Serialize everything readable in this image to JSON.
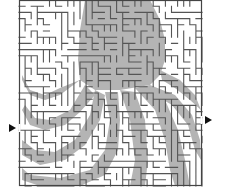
{
  "puzzle": {
    "type": "maze",
    "theme": "octopus silhouette",
    "frame": {
      "x": 19,
      "y": 0,
      "w": 183,
      "h": 186
    },
    "colors": {
      "background": "#ffffff",
      "shade": "#b4b4b4",
      "wall": "#555555",
      "arrow": "#111111"
    },
    "entrance": {
      "side": "left",
      "y": 128
    },
    "exit": {
      "side": "right",
      "y": 120
    },
    "grid": {
      "cols": 30,
      "rows": 30
    }
  }
}
